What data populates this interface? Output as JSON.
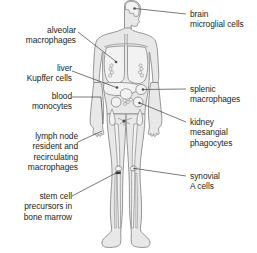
{
  "colors": {
    "outline": "#8a8a8a",
    "body_fill": "#e8e8e8",
    "organ_fill": "#f2f2f2",
    "leader_line": "#4d4d4d",
    "text": "#231f20",
    "background": "#ffffff"
  },
  "labels_left": [
    {
      "id": "alveolar-macrophages",
      "line1": "alveolar",
      "line2": "macrophages",
      "text": "alveolar\nmacrophages",
      "target": "lung"
    },
    {
      "id": "liver-kupffer-cells",
      "line1": "liver",
      "line2": "Kupffer cells",
      "text": "liver\nKupffer cells",
      "target": "liver"
    },
    {
      "id": "blood-monocytes",
      "line1": "blood",
      "line2": "monocytes",
      "text": "blood\nmonocytes",
      "target": "blood-vessel"
    },
    {
      "id": "lymph-node-macrophages",
      "line1": "lymph node",
      "line2": "resident and",
      "line3": "recirculating",
      "line4": "macrophages",
      "text": "lymph node\nresident and\nrecirculating\nmacrophages",
      "target": "inguinal-lymph-node"
    },
    {
      "id": "stem-cell-precursors",
      "line1": "stem cell",
      "line2": "precursors in",
      "line3": "bone marrow",
      "text": "stem cell\nprecursors in\nbone marrow",
      "target": "tibia-bone-marrow"
    }
  ],
  "labels_right": [
    {
      "id": "brain-microglial-cells",
      "line1": "brain",
      "line2": "microglial cells",
      "text": "brain\nmicroglial cells",
      "target": "brain"
    },
    {
      "id": "splenic-macrophages",
      "line1": "splenic",
      "line2": "macrophages",
      "text": "splenic\nmacrophages",
      "target": "spleen"
    },
    {
      "id": "kidney-mesangial-phagocytes",
      "line1": "kidney",
      "line2": "mesangial",
      "line3": "phagocytes",
      "text": "kidney\nmesangial\nphagocytes",
      "target": "kidney"
    },
    {
      "id": "synovial-a-cells",
      "line1": "synovial",
      "line2": "A cells",
      "text": "synovial\nA cells",
      "target": "knee-joint"
    }
  ]
}
